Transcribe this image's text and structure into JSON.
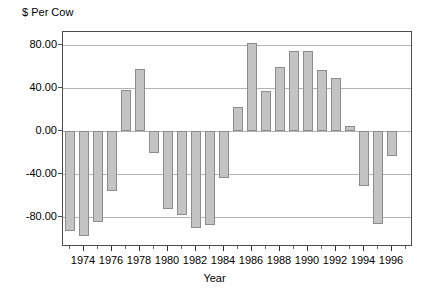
{
  "chart_data": {
    "type": "bar",
    "title": "",
    "ylabel": "$ Per Cow",
    "xlabel": "Year",
    "ylim": [
      -108,
      92
    ],
    "yticks": [
      80,
      40,
      0,
      -40,
      -80
    ],
    "ytick_labels": [
      "80.00",
      "40.00",
      "0.00",
      "-40.00",
      "-80.00"
    ],
    "grid": true,
    "legend": "none",
    "bar_color": "#c4c4c4",
    "bar_edge_color": "#8c8c8c",
    "xtick_labels": [
      "1974",
      "1976",
      "1978",
      "1980",
      "1982",
      "1984",
      "1986",
      "1988",
      "1990",
      "1992",
      "1994",
      "1996"
    ],
    "categories": [
      "1973",
      "1974",
      "1975",
      "1976",
      "1977",
      "1978",
      "1979",
      "1980",
      "1981",
      "1982",
      "1983",
      "1984",
      "1985",
      "1986",
      "1987",
      "1988",
      "1989",
      "1990",
      "1991",
      "1992",
      "1993",
      "1994",
      "1995",
      "1996",
      "1997"
    ],
    "values": [
      -93,
      -98,
      -85,
      -56,
      38,
      58,
      -21,
      -73,
      -78,
      -90,
      -88,
      -44,
      22,
      82,
      37,
      59,
      74,
      74,
      57,
      49,
      5,
      -51,
      -87,
      -23,
      0
    ],
    "data_points": [
      {
        "year": "1973",
        "value": -93
      },
      {
        "year": "1974",
        "value": -98
      },
      {
        "year": "1975",
        "value": -85
      },
      {
        "year": "1976",
        "value": -56
      },
      {
        "year": "1977",
        "value": 38
      },
      {
        "year": "1978",
        "value": 58
      },
      {
        "year": "1979",
        "value": -21
      },
      {
        "year": "1980",
        "value": -73
      },
      {
        "year": "1981",
        "value": -78
      },
      {
        "year": "1982",
        "value": -90
      },
      {
        "year": "1983",
        "value": -88
      },
      {
        "year": "1984",
        "value": -44
      },
      {
        "year": "1985",
        "value": 22
      },
      {
        "year": "1986",
        "value": 82
      },
      {
        "year": "1987",
        "value": 37
      },
      {
        "year": "1988",
        "value": 59
      },
      {
        "year": "1989",
        "value": 74
      },
      {
        "year": "1990",
        "value": 74
      },
      {
        "year": "1991",
        "value": 57
      },
      {
        "year": "1992",
        "value": 49
      },
      {
        "year": "1993",
        "value": 5
      },
      {
        "year": "1994",
        "value": -51
      },
      {
        "year": "1995",
        "value": -87
      },
      {
        "year": "1996",
        "value": -23
      }
    ]
  }
}
